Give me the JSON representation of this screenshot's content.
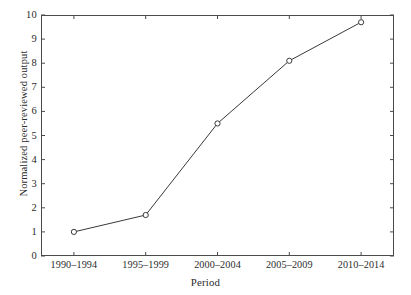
{
  "chart_data": {
    "type": "line",
    "title": "",
    "subtitle": "",
    "xlabel": "Period",
    "ylabel": "Normalized peer-reviewed output",
    "categories": [
      "1990–1994",
      "1995–1999",
      "2000–2004",
      "2005–2009",
      "2010–2014"
    ],
    "values": [
      1.0,
      1.7,
      5.5,
      8.1,
      9.7
    ],
    "series": [
      {
        "name": "Normalized peer-reviewed output",
        "values": [
          1.0,
          1.7,
          5.5,
          8.1,
          9.7
        ]
      }
    ],
    "ylim": [
      0,
      10
    ],
    "yticks": [
      0,
      1,
      2,
      3,
      4,
      5,
      6,
      7,
      8,
      9,
      10
    ],
    "ytick_labels": [
      "0",
      "1",
      "2",
      "3",
      "4",
      "5",
      "6",
      "7",
      "8",
      "9",
      "10"
    ],
    "xtick_labels": [
      "1990–1994",
      "1995–1999",
      "2000–2004",
      "2005–2009",
      "2010–2014"
    ],
    "grid": false,
    "legend": false,
    "legend_position": "none",
    "marker": "open-circle",
    "line_color": "#3a3a3a",
    "marker_color": "#3a3a3a",
    "axis_color": "#4a4a4a",
    "background_color": "#ffffff",
    "annotations": []
  },
  "figure": {
    "caption_remnant": ""
  }
}
